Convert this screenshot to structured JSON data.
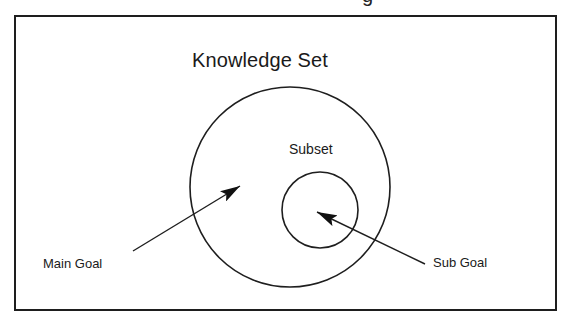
{
  "diagram": {
    "clipped_header_fragment": "g",
    "title": "Knowledge Set",
    "regions": {
      "outer_set": {
        "label": "Knowledge Set",
        "shape": "circle",
        "cx": 290,
        "cy": 187,
        "r": 100
      },
      "inner_set": {
        "label": "Subset",
        "shape": "circle",
        "cx": 320,
        "cy": 210,
        "r": 38
      }
    },
    "labels": {
      "subset": "Subset",
      "main_goal": "Main Goal",
      "sub_goal": "Sub Goal"
    },
    "arrows": [
      {
        "name": "main-goal-arrow",
        "from_label": "Main Goal",
        "points_to": "outer_set",
        "x1": 133,
        "y1": 251,
        "x2": 240,
        "y2": 186
      },
      {
        "name": "sub-goal-arrow",
        "from_label": "Sub Goal",
        "points_to": "inner_set",
        "x1": 425,
        "y1": 264,
        "x2": 317,
        "y2": 212
      }
    ],
    "colors": {
      "stroke": "#1e1e1e",
      "text": "#1a1a1a",
      "background": "#ffffff"
    }
  }
}
